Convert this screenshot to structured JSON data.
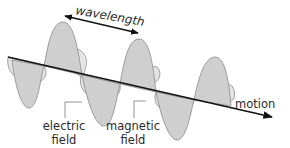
{
  "diagram": {
    "labels": {
      "wavelength": "wavelength",
      "electric_line1": "electric",
      "electric_line2": "field",
      "magnetic_line1": "magnetic",
      "magnetic_line2": "field",
      "motion": "motion"
    },
    "colors": {
      "electric_fill": "#cfcfcf",
      "magnetic_fill": "#e4e4e4",
      "outline": "#8a8a8a",
      "axis": "#111111",
      "leader": "#777777",
      "text": "#2a2a2a"
    }
  }
}
